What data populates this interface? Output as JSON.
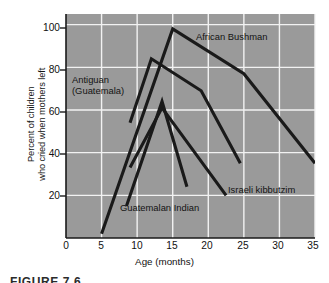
{
  "figure": {
    "caption": "FIGURE 7.6"
  },
  "chart_data": {
    "type": "line",
    "title": "",
    "xlabel": "Age (months)",
    "ylabel": "Percent of children who cried when mothers left",
    "ylabel_line1": "Percent of children",
    "ylabel_line2": "who cried when mothers left",
    "xlim": [
      0,
      35
    ],
    "ylim": [
      0,
      105
    ],
    "xticks": [
      0,
      5,
      10,
      15,
      20,
      25,
      30,
      35
    ],
    "yticks": [
      20,
      40,
      60,
      80,
      100
    ],
    "grid": true,
    "grid_color": "#f2f2f2",
    "plot_bgcolor": "#9a9a9a",
    "line_color": "#1a1a1a",
    "legend_position": "inline-annotations",
    "series": [
      {
        "name": "African Bushman",
        "label": "African Bushman",
        "x": [
          5,
          15,
          25,
          35
        ],
        "y": [
          2,
          98,
          77,
          35
        ]
      },
      {
        "name": "Antiguan (Guatemala)",
        "label_line1": "Antiguan",
        "label_line2": "(Guatemala)",
        "x": [
          9,
          12,
          19,
          24.5
        ],
        "y": [
          54,
          84,
          69,
          35
        ]
      },
      {
        "name": "Israeli kibbutzim",
        "label": "Israeli kibbutzim",
        "x": [
          9,
          13.5,
          22.5
        ],
        "y": [
          33,
          61,
          20
        ]
      },
      {
        "name": "Guatemalan Indian",
        "label": "Guatemalan Indian",
        "x": [
          8.5,
          13.5,
          17
        ],
        "y": [
          15,
          64,
          24
        ]
      }
    ]
  }
}
